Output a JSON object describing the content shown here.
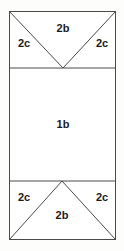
{
  "figure": {
    "type": "geometric-net-diagram",
    "canvas": {
      "width": 124,
      "height": 251,
      "background": "#fdfdfc"
    },
    "stroke": {
      "color": "#4a4a4a",
      "width": 1
    },
    "outline": {
      "name": "outer-rectangle",
      "x": 9,
      "y": 11,
      "width": 107,
      "height": 229
    },
    "dividers": [
      {
        "name": "upper-divider",
        "x1": 9,
        "y1": 68,
        "x2": 116,
        "y2": 68
      },
      {
        "name": "lower-divider",
        "x1": 9,
        "y1": 181,
        "x2": 116,
        "y2": 181
      }
    ],
    "fold_lines": [
      {
        "name": "top-left-diagonal",
        "x1": 9,
        "y1": 11,
        "x2": 63,
        "y2": 68
      },
      {
        "name": "top-right-diagonal",
        "x1": 116,
        "y1": 11,
        "x2": 63,
        "y2": 68
      },
      {
        "name": "bottom-left-diagonal",
        "x1": 9,
        "y1": 240,
        "x2": 62,
        "y2": 181
      },
      {
        "name": "bottom-right-diagonal",
        "x1": 116,
        "y1": 240,
        "x2": 62,
        "y2": 181
      }
    ],
    "labels": [
      {
        "name": "label-top-2b",
        "text": "2b",
        "x": 63,
        "y": 28
      },
      {
        "name": "label-top-left-2c",
        "text": "2c",
        "x": 24,
        "y": 43
      },
      {
        "name": "label-top-right-2c",
        "text": "2c",
        "x": 102,
        "y": 43
      },
      {
        "name": "label-center-1b",
        "text": "1b",
        "x": 63,
        "y": 124
      },
      {
        "name": "label-bottom-left-2c",
        "text": "2c",
        "x": 24,
        "y": 197
      },
      {
        "name": "label-bottom-right-2c",
        "text": "2c",
        "x": 102,
        "y": 197
      },
      {
        "name": "label-bottom-2b",
        "text": "2b",
        "x": 62,
        "y": 215
      }
    ]
  }
}
